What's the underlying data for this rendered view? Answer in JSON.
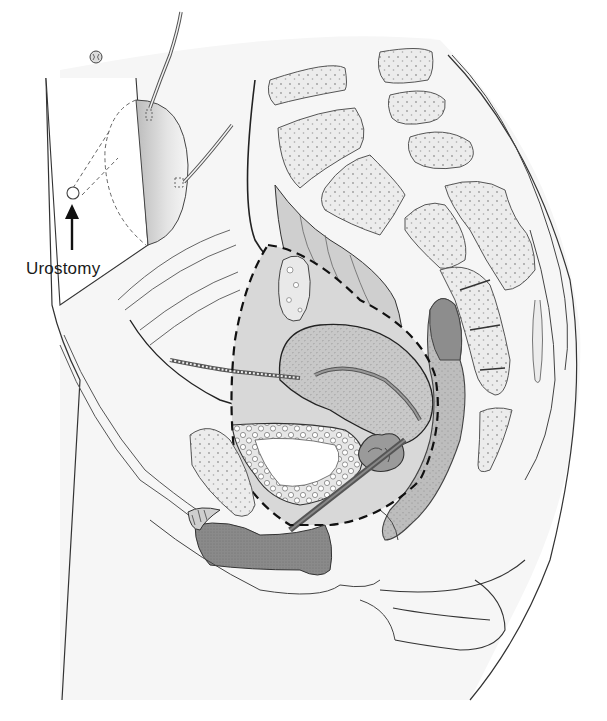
{
  "figure": {
    "type": "anatomical illustration",
    "view": "sagittal section of female pelvis with urostomy",
    "labels": [
      {
        "id": "urostomy",
        "text": "Urostomy",
        "pointer": "arrow pointing up to stoma"
      }
    ],
    "colors": {
      "background": "#ffffff",
      "outline": "#3a3a3a",
      "skin_shade": "#f4f4f4",
      "bone_fill": "#ececec",
      "bone_dots": "#9a9a9a",
      "organ_light": "#d2d2d2",
      "organ_mid": "#b8b8b8",
      "organ_dark": "#8c8c8c",
      "resection_line": "#111111"
    },
    "structures": [
      "stoma appliance bag",
      "stoma (urostomy)",
      "umbilicus",
      "ureters",
      "lumbar vertebrae",
      "sacrum",
      "coccyx",
      "sigmoid colon",
      "rectum",
      "uterus",
      "ovary",
      "bladder",
      "pubic symphysis",
      "clitoris",
      "vagina",
      "tumor",
      "dashed resection boundary"
    ]
  }
}
